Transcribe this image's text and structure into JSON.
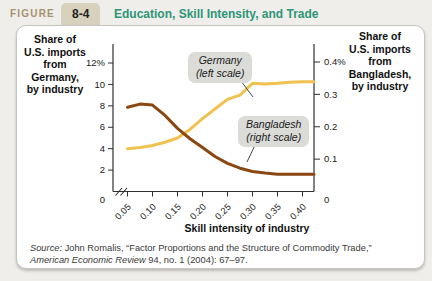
{
  "header": {
    "kicker": "FIGURE",
    "number": "8-4",
    "title": "Education, Skill Intensity, and Trade"
  },
  "theme": {
    "title_color": "#2E9577",
    "kicker_color": "#A6926F",
    "tab_bg": "#D8D1BD",
    "card_bg": "#FFFFFF",
    "callout_bg": "#DBDBD8",
    "axis_color": "#2F2F2F"
  },
  "axis_blocks": {
    "left": [
      "Share of",
      "U.S. imports",
      "from",
      "Germany,",
      "by industry"
    ],
    "right": [
      "Share of",
      "U.S. imports",
      "from",
      "Bangladesh,",
      "by industry"
    ]
  },
  "chart_data": {
    "type": "line",
    "title": "Education, Skill Intensity, and Trade",
    "xlabel": "Skill intensity of industry",
    "grid": false,
    "legend_position": "annotated-callouts",
    "x": [
      0.05,
      0.075,
      0.1,
      0.125,
      0.15,
      0.175,
      0.2,
      0.225,
      0.25,
      0.275,
      0.3,
      0.325,
      0.35,
      0.375,
      0.4
    ],
    "series": [
      {
        "name": "Germany",
        "axis": "left",
        "color": "#F0C24F",
        "values": [
          4.0,
          4.1,
          4.3,
          4.6,
          5.0,
          5.8,
          6.8,
          7.7,
          8.6,
          9.0,
          10.1,
          10.05,
          10.1,
          10.2,
          10.25
        ]
      },
      {
        "name": "Bangladesh",
        "axis": "right",
        "color": "#8A4711",
        "values": [
          0.26,
          0.27,
          0.267,
          0.235,
          0.195,
          0.163,
          0.136,
          0.108,
          0.087,
          0.072,
          0.062,
          0.057,
          0.053,
          0.053,
          0.053
        ]
      }
    ],
    "x_ticks": {
      "values": [
        0.05,
        0.1,
        0.15,
        0.2,
        0.25,
        0.3,
        0.35,
        0.4
      ],
      "labels": [
        "0.05",
        "0.10",
        "0.15",
        "0.20",
        "0.25",
        "0.30",
        "0.35",
        "0.40"
      ]
    },
    "left_axis": {
      "max": 12,
      "range": [
        0,
        12
      ],
      "tick_values": [
        12,
        10,
        8,
        6,
        4,
        2,
        0
      ],
      "tick_labels": [
        "12%",
        "10",
        "8",
        "6",
        "4",
        "2",
        "0"
      ]
    },
    "right_axis": {
      "max": 0.4,
      "range": [
        0,
        0.4
      ],
      "tick_values": [
        0.4,
        0.3,
        0.2,
        0.1,
        0
      ],
      "tick_labels": [
        "0.4%",
        "0.3",
        "0.2",
        "0.1",
        "0"
      ]
    },
    "axis_break": true,
    "callouts": [
      {
        "series": "Germany",
        "lines": [
          "Germany",
          "(left scale)"
        ]
      },
      {
        "series": "Bangladesh",
        "lines": [
          "Bangladesh",
          "(right scale)"
        ]
      }
    ]
  },
  "source": {
    "line1_italic": "Source:",
    "line1_rest": " John Romalis, “Factor Proportions and the Structure of Commodity Trade,”",
    "line2_italic": "American Economic Review",
    "line2_rest": " 94, no. 1 (2004): 67–97."
  }
}
